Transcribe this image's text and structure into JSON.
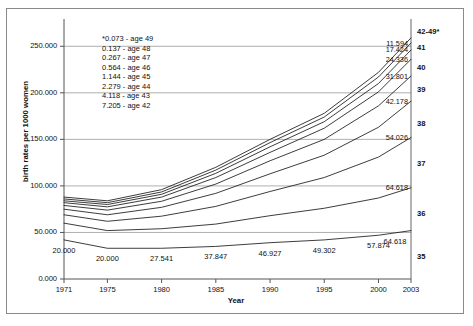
{
  "chart_data": {
    "type": "line",
    "title": "",
    "xlabel": "Year",
    "ylabel": "birth rates per 1000 women",
    "x": [
      1971,
      1975,
      1980,
      1985,
      1990,
      1995,
      2000,
      2003
    ],
    "xtick_labels": [
      "1971",
      "1975",
      "1980",
      "1985",
      "1990",
      "1995",
      "2000",
      "2003"
    ],
    "ytick_labels": [
      "0.000",
      "50.000",
      "100.000",
      "150.000",
      "200.000",
      "250.000"
    ],
    "ytick_values": [
      0,
      50,
      100,
      150,
      200,
      250
    ],
    "ylim": [
      0,
      275
    ],
    "xlim": [
      1971,
      2003
    ],
    "grid": true,
    "legend_position": "right-axis-labels",
    "series": [
      {
        "name": "42-49*",
        "end_label": "42-49*",
        "values": [
          88.0,
          84.0,
          96.0,
          120.0,
          150.0,
          178.0,
          222.0,
          259.0
        ]
      },
      {
        "name": "41",
        "end_label": "41",
        "value_label": "11.594",
        "values": [
          86.0,
          82.0,
          93.5,
          117.0,
          146.5,
          174.0,
          217.0,
          253.5
        ]
      },
      {
        "name": "40",
        "end_label": "40",
        "value_label": "17.424",
        "values": [
          84.0,
          80.0,
          91.0,
          113.5,
          142.0,
          169.0,
          210.0,
          246.0
        ]
      },
      {
        "name": "39",
        "end_label": "39",
        "value_label": "24.336",
        "values": [
          82.0,
          77.5,
          88.0,
          109.0,
          136.0,
          162.0,
          201.0,
          236.0
        ]
      },
      {
        "name": "38",
        "end_label": "38",
        "value_label": "31.801",
        "values": [
          79.0,
          74.0,
          83.5,
          102.0,
          127.0,
          150.0,
          186.0,
          218.0
        ]
      },
      {
        "name": "37",
        "end_label": "37",
        "value_label": "42.178",
        "values": [
          75.0,
          69.0,
          77.0,
          92.0,
          113.0,
          133.0,
          163.0,
          191.0
        ]
      },
      {
        "name": "36",
        "end_label": "36",
        "value_label": "54.026",
        "values": [
          69.0,
          62.0,
          67.5,
          78.0,
          94.0,
          109.0,
          131.0,
          152.0
        ]
      },
      {
        "name": "35",
        "end_label": "35",
        "value_label": "64.618",
        "values": [
          60.0,
          52.0,
          54.0,
          59.0,
          68.0,
          76.0,
          87.0,
          98.0
        ]
      },
      {
        "name": "lowest",
        "end_label": "",
        "values": [
          42.0,
          33.0,
          33.0,
          35.0,
          39.0,
          42.0,
          47.0,
          52.0
        ]
      }
    ],
    "point_labels": [
      {
        "text": "20.000",
        "x": 1971
      },
      {
        "text": "20.000",
        "x": 1975
      },
      {
        "text": "27.541",
        "x": 1980
      },
      {
        "text": "37.847",
        "x": 1985
      },
      {
        "text": "46.927",
        "x": 1990
      },
      {
        "text": "49.302",
        "x": 1995
      },
      {
        "text": "57.874",
        "x": 2000
      },
      {
        "text": "64.618",
        "x": 2003
      }
    ],
    "annotations": [
      "*0.073 - age 49",
      "0.137 - age 48",
      "0.267 - age 47",
      "0.564 - age 46",
      "1.144 - age 45",
      "2.279 - age 44",
      "4.118 - age 43",
      "7.205 - age 42"
    ],
    "colors": {
      "line": "#1a1a1a",
      "grid": "#9a9a9a",
      "axis": "#555555",
      "frame": "#8a8a8a",
      "text": "#111111"
    }
  }
}
